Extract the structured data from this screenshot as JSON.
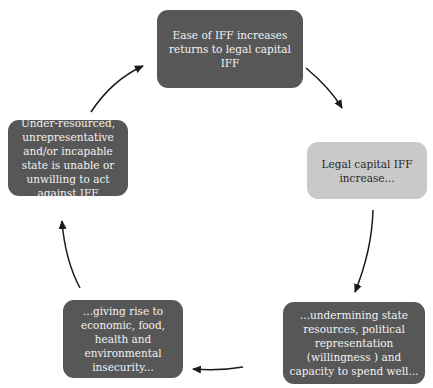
{
  "diagram": {
    "type": "cycle",
    "nodes": [
      {
        "id": "top",
        "text": "Ease of IFF increases returns to legal capital IFF",
        "style": "dark"
      },
      {
        "id": "right",
        "text": "Legal capital IFF increase...",
        "style": "light"
      },
      {
        "id": "bottom_right",
        "text": "...undermining state resources, political representation (willingness ) and capacity to spend well...",
        "style": "dark"
      },
      {
        "id": "bottom_left",
        "text": "...giving rise to economic, food, health and environmental insecurity...",
        "style": "dark"
      },
      {
        "id": "left",
        "text": "Under-resourced, unrepresentative and/or incapable state is unable or unwilling to act against IFF",
        "style": "dark"
      }
    ],
    "edges": [
      {
        "from": "top",
        "to": "right"
      },
      {
        "from": "right",
        "to": "bottom_right"
      },
      {
        "from": "bottom_right",
        "to": "bottom_left"
      },
      {
        "from": "bottom_left",
        "to": "left"
      },
      {
        "from": "left",
        "to": "top"
      }
    ],
    "colors": {
      "dark_box": "#575757",
      "light_box": "#c9c9c9",
      "arrow": "#1a1a1a",
      "dark_text": "#f2f2f2",
      "light_text": "#2a2a2a"
    }
  }
}
